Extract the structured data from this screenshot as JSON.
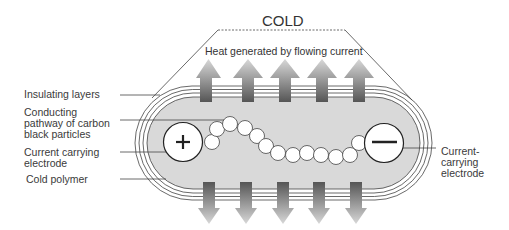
{
  "diagram": {
    "top_label": "COLD",
    "heat_label": "Heat generated by flowing current",
    "labels": {
      "insulating_layers": "Insulating layers",
      "conducting_pathway": "Conducting\npathway of carbon\nblack particles",
      "left_electrode": "Current carrying\nelectrode",
      "cold_polymer": "Cold polymer",
      "right_electrode": "Current-\ncarrying\nelectrode"
    },
    "electrodes": [
      {
        "polarity": "+",
        "icon": "plus-icon"
      },
      {
        "polarity": "−",
        "icon": "minus-icon"
      }
    ],
    "arrows": {
      "up_count": 5,
      "down_count": 5
    },
    "colors": {
      "polymer_fill": "#d9d9d9",
      "outline": "#333333",
      "arrow_dark": "#555555",
      "arrow_light": "#d8d8d8"
    }
  }
}
